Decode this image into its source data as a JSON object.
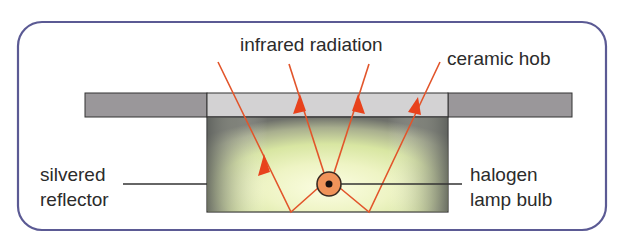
{
  "diagram": {
    "labels": {
      "infrared": "infrared radiation",
      "ceramic": "ceramic hob",
      "reflector_line1": "silvered",
      "reflector_line2": "reflector",
      "bulb_line1": "halogen",
      "bulb_line2": "lamp bulb"
    },
    "colors": {
      "frame": "#5b5a94",
      "hob_dark": "#9a979a",
      "hob_light": "#d3d2d3",
      "ray": "#e2552b",
      "arrowhead": "#e8421c",
      "bulb_fill": "#f0935a",
      "glow_center": "#fbfde0",
      "glow_mid": "#dde9a6",
      "glow_edge": "#7d7f74",
      "leader_line": "#333333"
    },
    "components": [
      "ceramic hob",
      "silvered reflector",
      "halogen lamp bulb",
      "infrared radiation rays"
    ]
  }
}
